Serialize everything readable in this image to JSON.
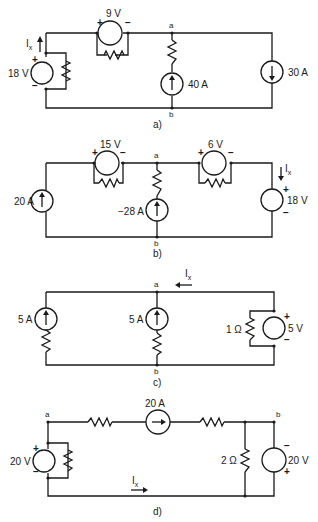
{
  "figure": {
    "circuits": [
      {
        "caption": "a)",
        "nodes": {
          "a": "a",
          "b": "b"
        },
        "labels": {
          "ix": "I",
          "ix_sub": "x",
          "v_left": "18 V",
          "v_top": "9 V",
          "i_middle": "40 A",
          "i_right": "30 A"
        },
        "polarity": {
          "plus": "+",
          "minus": "−"
        }
      },
      {
        "caption": "b)",
        "nodes": {
          "a": "a",
          "b": "b"
        },
        "labels": {
          "ix": "I",
          "ix_sub": "x",
          "i_left": "20 A",
          "v_top_left": "15 V",
          "v_top_right": "6 V",
          "i_middle": "−28 A",
          "v_right": "18 V"
        },
        "polarity": {
          "plus": "+",
          "minus": "−"
        }
      },
      {
        "caption": "c)",
        "nodes": {
          "a": "a",
          "b": "b"
        },
        "labels": {
          "ix": "I",
          "ix_sub": "x",
          "i_left": "5 A",
          "i_middle": "5 A",
          "r_right": "1 Ω",
          "v_right": "5 V"
        },
        "polarity": {
          "plus": "+",
          "minus": "−"
        }
      },
      {
        "caption": "d)",
        "nodes": {
          "a": "a",
          "b": "b"
        },
        "labels": {
          "ix": "I",
          "ix_sub": "x",
          "v_left": "20 V",
          "i_top": "20 A",
          "r_right": "2 Ω",
          "v_right": "20 V"
        },
        "polarity": {
          "plus": "+",
          "minus": "−"
        }
      }
    ]
  }
}
